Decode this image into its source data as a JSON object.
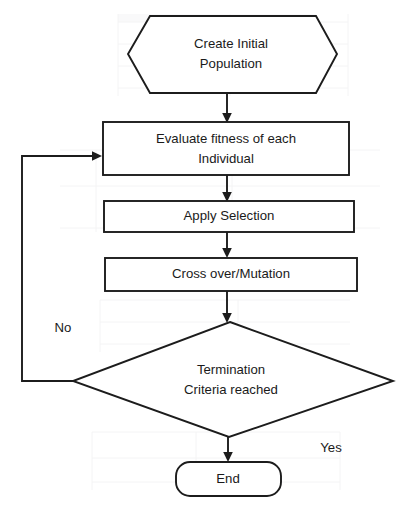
{
  "diagram": {
    "type": "flowchart",
    "nodes": [
      {
        "id": "create-initial-population",
        "shape": "hexagon",
        "lines": [
          "Create Initial",
          "Population"
        ],
        "line1": "Create Initial",
        "line2": "Population"
      },
      {
        "id": "evaluate-fitness",
        "shape": "rectangle",
        "lines": [
          "Evaluate fitness of each",
          "Individual"
        ],
        "line1": "Evaluate fitness of each",
        "line2": "Individual"
      },
      {
        "id": "apply-selection",
        "shape": "rectangle",
        "lines": [
          "Apply Selection"
        ],
        "line1": "Apply Selection"
      },
      {
        "id": "crossover-mutation",
        "shape": "rectangle",
        "lines": [
          "Cross over/Mutation"
        ],
        "line1": "Cross over/Mutation"
      },
      {
        "id": "termination-criteria",
        "shape": "diamond",
        "lines": [
          "Termination",
          "Criteria reached"
        ],
        "line1": "Termination",
        "line2": "Criteria reached"
      },
      {
        "id": "end",
        "shape": "rounded-rectangle",
        "lines": [
          "End"
        ],
        "line1": "End"
      }
    ],
    "edges": [
      {
        "id": "e1",
        "from": "create-initial-population",
        "to": "evaluate-fitness",
        "label": ""
      },
      {
        "id": "e2",
        "from": "evaluate-fitness",
        "to": "apply-selection",
        "label": ""
      },
      {
        "id": "e3",
        "from": "apply-selection",
        "to": "crossover-mutation",
        "label": ""
      },
      {
        "id": "e4",
        "from": "crossover-mutation",
        "to": "termination-criteria",
        "label": ""
      },
      {
        "id": "e5",
        "from": "termination-criteria",
        "to": "evaluate-fitness",
        "label": "No"
      },
      {
        "id": "e6",
        "from": "termination-criteria",
        "to": "end",
        "label": "Yes"
      }
    ],
    "edge_labels": {
      "no": "No",
      "yes": "Yes"
    },
    "colors": {
      "stroke": "#1c1c1c",
      "fill": "#ffffff",
      "text": "#1a1a1a",
      "background": "#ffffff"
    }
  }
}
